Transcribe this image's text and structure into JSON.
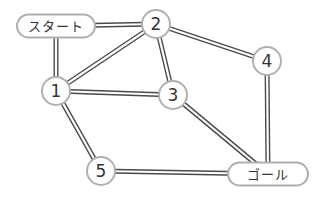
{
  "diagram": {
    "type": "graph",
    "start_label": "スタート",
    "goal_label": "ゴール",
    "nodes": [
      {
        "id": "start",
        "label": "スタート",
        "shape": "pill",
        "x": 56,
        "y": 26,
        "w": 78,
        "h": 23
      },
      {
        "id": "1",
        "label": "1",
        "shape": "circle",
        "x": 56,
        "y": 91,
        "r": 14
      },
      {
        "id": "2",
        "label": "2",
        "shape": "circle",
        "x": 156,
        "y": 24,
        "r": 14
      },
      {
        "id": "3",
        "label": "3",
        "shape": "circle",
        "x": 173,
        "y": 95,
        "r": 14
      },
      {
        "id": "4",
        "label": "4",
        "shape": "circle",
        "x": 267,
        "y": 61,
        "r": 14
      },
      {
        "id": "5",
        "label": "5",
        "shape": "circle",
        "x": 101,
        "y": 171,
        "r": 14
      },
      {
        "id": "goal",
        "label": "ゴール",
        "shape": "pill",
        "x": 268,
        "y": 174,
        "w": 80,
        "h": 23
      }
    ],
    "edges": [
      {
        "from": "start",
        "to": "2"
      },
      {
        "from": "start",
        "to": "1"
      },
      {
        "from": "1",
        "to": "2"
      },
      {
        "from": "1",
        "to": "3"
      },
      {
        "from": "1",
        "to": "5"
      },
      {
        "from": "2",
        "to": "3"
      },
      {
        "from": "2",
        "to": "4"
      },
      {
        "from": "3",
        "to": "goal"
      },
      {
        "from": "4",
        "to": "goal"
      },
      {
        "from": "5",
        "to": "goal"
      }
    ],
    "colors": {
      "edge_outer": "#4a4a4a",
      "edge_inner": "#ffffff",
      "node_stroke": "#b0b0b0",
      "node_fill": "#ffffff",
      "text": "#333333"
    }
  }
}
